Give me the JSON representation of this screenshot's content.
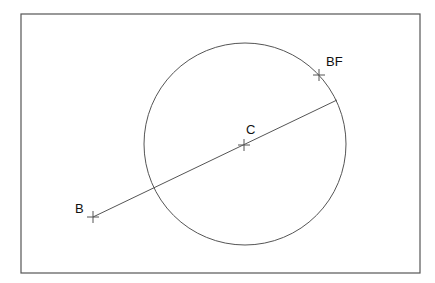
{
  "diagram": {
    "frame": {
      "x": 21,
      "y": 14,
      "width": 399,
      "height": 259,
      "stroke": "#555555"
    },
    "circle": {
      "cx": 245,
      "cy": 144,
      "r": 101,
      "stroke": "#555555"
    },
    "segment": {
      "from": "B",
      "to_point": [
        337,
        100
      ]
    },
    "points": [
      {
        "id": "B",
        "label": "B",
        "x": 93,
        "y": 217
      },
      {
        "id": "C",
        "label": "C",
        "x": 244,
        "y": 145
      },
      {
        "id": "BF",
        "label": "BF",
        "x": 319,
        "y": 75
      }
    ]
  },
  "labels": {
    "B": "B",
    "C": "C",
    "BF": "BF"
  }
}
